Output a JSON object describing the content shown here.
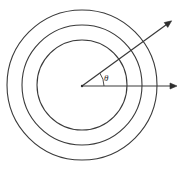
{
  "figure": {
    "background_color": "#ffffff",
    "stroke_color": "#3a3a3a",
    "width": 182,
    "height": 172
  },
  "center": {
    "label": "origin",
    "x": 82,
    "y": 86
  },
  "circles": [
    {
      "name": "outer-circle",
      "cx": 82,
      "cy": 85,
      "r": 75
    },
    {
      "name": "middle-circle",
      "cx": 82,
      "cy": 85,
      "r": 60
    },
    {
      "name": "inner-circle",
      "cx": 82,
      "cy": 85,
      "r": 45
    }
  ],
  "rays": [
    {
      "name": "horizontal-ray",
      "from_x": 82,
      "from_y": 86,
      "to_x": 172,
      "to_y": 86,
      "angle_deg": 0,
      "has_arrowhead": true
    },
    {
      "name": "diagonal-ray",
      "from_x": 82,
      "from_y": 86,
      "to_x": 167,
      "to_y": 23,
      "angle_deg": 36,
      "has_arrowhead": true
    }
  ],
  "angle": {
    "symbol": "θ",
    "label_x": 104,
    "label_y": 81,
    "arc_radius": 22,
    "start_deg": 0,
    "end_deg": 36
  }
}
